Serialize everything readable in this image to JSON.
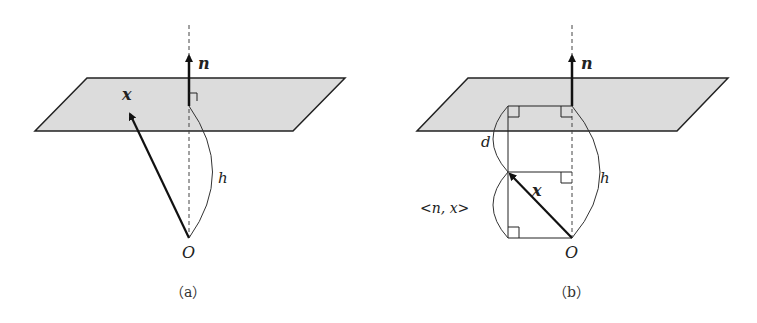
{
  "colors": {
    "plane_fill": "#dcdcdc",
    "stroke": "#222222",
    "background": "#ffffff"
  },
  "panels": [
    {
      "id": "a",
      "caption": "（a）",
      "labels": {
        "normal": "n",
        "vector": "x",
        "height": "h",
        "origin": "O"
      }
    },
    {
      "id": "b",
      "caption": "（b）",
      "labels": {
        "normal": "n",
        "vector": "x",
        "height": "h",
        "origin": "O",
        "distance": "d",
        "inner_product": "<n, x>"
      }
    }
  ]
}
